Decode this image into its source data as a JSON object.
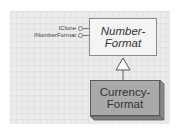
{
  "diagram": {
    "type": "uml-class-inheritance",
    "base_class": {
      "name_line1": "Number-",
      "name_line2": "Format",
      "full_name": "NumberFormat",
      "italic": true,
      "interfaces": [
        {
          "label": "IClone"
        },
        {
          "label": "INumberFormat"
        }
      ]
    },
    "derived_class": {
      "name_line1": "Currency-",
      "name_line2": "Format",
      "full_name": "CurrencyFormat"
    },
    "relationship": "inherits",
    "colors": {
      "panel_bg": "#ebebeb",
      "base_fill": "#f4f4f4",
      "derived_fill": "#a9a9a9",
      "derived_side": "#8c8c8c",
      "line": "#666666"
    }
  }
}
